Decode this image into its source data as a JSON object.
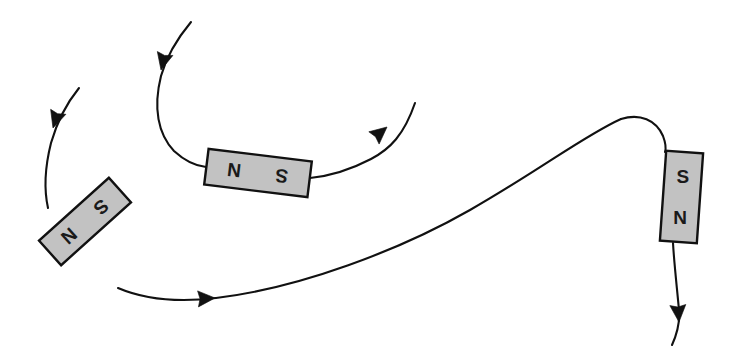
{
  "figure": {
    "background_color": "#ffffff",
    "line_color": "#111111",
    "magnet_fill": "#c2c2c2",
    "magnet_stroke": "#111111",
    "label_color": "#1a1a1a"
  },
  "magnets": [
    {
      "id": "magnet-left",
      "name": "left-magnet",
      "orientation": "diagonal",
      "rotation_deg": 138,
      "south_label": "S",
      "north_label": "N",
      "x": 38,
      "y": 205,
      "width": 94,
      "height": 33
    },
    {
      "id": "magnet-middle",
      "name": "middle-magnet",
      "orientation": "horizontal",
      "rotation_deg": 187,
      "south_label": "S",
      "north_label": "N",
      "x": 206,
      "y": 155,
      "width": 104,
      "height": 36
    },
    {
      "id": "magnet-right",
      "name": "right-magnet",
      "orientation": "vertical",
      "rotation_deg": 4,
      "south_label": "S",
      "north_label": "N",
      "x": 663,
      "y": 152,
      "width": 37,
      "height": 90
    }
  ],
  "field_lines": [
    {
      "id": "line-left",
      "name": "left-field-line",
      "path": "M 79 88 C 66 104 57 122 51 143 C 45 167 44 190 48 208",
      "arrow_count": 1
    },
    {
      "id": "line-left-lower",
      "name": "left-field-line-lower",
      "path": "M 118 288 C 146 300 182 302 216 298 C 300 288 400 250 470 210 C 540 170 585 135 621 119",
      "arrow_count": 1
    },
    {
      "id": "line-middle-in",
      "name": "middle-field-line-inflow",
      "path": "M 191 22 C 176 40 166 58 161 76 C 153 108 158 134 174 151 C 186 162 196 166 206 167",
      "arrow_count": 1
    },
    {
      "id": "line-middle-out",
      "name": "middle-field-line-outflow",
      "path": "M 310 178 C 330 176 350 170 371 159 C 390 149 404 135 415 103",
      "arrow_count": 1
    },
    {
      "id": "line-right-hump",
      "name": "right-field-line-hump",
      "path": "M 621 119 C 640 113 656 120 663 136 C 666 144 666 149 665 152",
      "arrow_count": 0
    },
    {
      "id": "line-right-tail",
      "name": "right-field-line-tail",
      "path": "M 673 243 C 674 262 677 288 679 310 C 680 322 677 334 672 345",
      "arrow_count": 1
    }
  ],
  "arrows": [
    {
      "id": "arrow-left-down",
      "name": "arrow-left-downward",
      "x": 53,
      "y": 128,
      "angle_deg": 108
    },
    {
      "id": "arrow-middle-down",
      "name": "arrow-middle-downward",
      "x": 161,
      "y": 70,
      "angle_deg": 104
    },
    {
      "id": "arrow-middle-right",
      "name": "arrow-middle-up-right",
      "x": 387,
      "y": 127,
      "angle_deg": -40
    },
    {
      "id": "arrow-bottom-right",
      "name": "arrow-bottom-rightward",
      "x": 215,
      "y": 298,
      "angle_deg": -3
    },
    {
      "id": "arrow-right-down",
      "name": "arrow-right-downward",
      "x": 679,
      "y": 322,
      "angle_deg": 86
    }
  ]
}
